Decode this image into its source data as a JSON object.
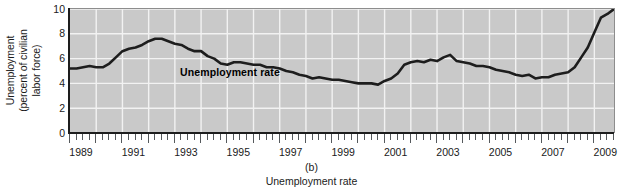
{
  "figure": {
    "panel_letter": "(b)",
    "caption_title": "Unemployment rate",
    "series_label": "Unemployment rate",
    "background_color": "#c9c9c9",
    "gridline_color": "#f2f2f2",
    "line_color": "#1d1d1d",
    "axis_color": "#1d1d1d"
  },
  "axes": {
    "ylabel_line1": "Unemployment",
    "ylabel_line2": "(percent of civilian",
    "ylabel_line3": "labor force)",
    "y_ticks": [
      "0",
      "2",
      "4",
      "6",
      "8",
      "10"
    ],
    "x_ticks": [
      "1989",
      "1991",
      "1993",
      "1995",
      "1997",
      "1999",
      "2001",
      "2003",
      "2005",
      "2007",
      "2009"
    ]
  },
  "chart_data": {
    "type": "line",
    "title": "Unemployment rate",
    "xlabel": "",
    "ylabel": "Unemployment (percent of civilian labor force)",
    "xlim": [
      1989,
      2009.75
    ],
    "ylim": [
      0,
      10
    ],
    "ytick_values": [
      0,
      2,
      4,
      6,
      8,
      10
    ],
    "xtick_values": [
      1989,
      1991,
      1993,
      1995,
      1997,
      1999,
      2001,
      2003,
      2005,
      2007,
      2009
    ],
    "grid": "vertical and horizontal white gridlines at tick values",
    "legend": "inline label inside plot area",
    "annotations": [
      {
        "text": "Unemployment rate",
        "x": 1993.2,
        "y": 4.9,
        "bold": true
      }
    ],
    "series": [
      {
        "name": "Unemployment rate",
        "units": "percent of civilian labor force",
        "x": [
          1989.0,
          1989.25,
          1989.5,
          1989.75,
          1990.0,
          1990.25,
          1990.5,
          1990.75,
          1991.0,
          1991.25,
          1991.5,
          1991.75,
          1992.0,
          1992.25,
          1992.5,
          1992.75,
          1993.0,
          1993.25,
          1993.5,
          1993.75,
          1994.0,
          1994.25,
          1994.5,
          1994.75,
          1995.0,
          1995.25,
          1995.5,
          1995.75,
          1996.0,
          1996.25,
          1996.5,
          1996.75,
          1997.0,
          1997.25,
          1997.5,
          1997.75,
          1998.0,
          1998.25,
          1998.5,
          1998.75,
          1999.0,
          1999.25,
          1999.5,
          1999.75,
          2000.0,
          2000.25,
          2000.5,
          2000.75,
          2001.0,
          2001.25,
          2001.5,
          2001.75,
          2002.0,
          2002.25,
          2002.5,
          2002.75,
          2003.0,
          2003.25,
          2003.5,
          2003.75,
          2004.0,
          2004.25,
          2004.5,
          2004.75,
          2005.0,
          2005.25,
          2005.5,
          2005.75,
          2006.0,
          2006.25,
          2006.5,
          2006.75,
          2007.0,
          2007.25,
          2007.5,
          2007.75,
          2008.0,
          2008.25,
          2008.5,
          2008.75,
          2009.0,
          2009.25,
          2009.5,
          2009.75
        ],
        "y": [
          5.2,
          5.2,
          5.3,
          5.4,
          5.3,
          5.3,
          5.6,
          6.1,
          6.6,
          6.8,
          6.9,
          7.1,
          7.4,
          7.6,
          7.6,
          7.4,
          7.2,
          7.1,
          6.8,
          6.6,
          6.6,
          6.2,
          6.0,
          5.6,
          5.5,
          5.7,
          5.7,
          5.6,
          5.5,
          5.5,
          5.3,
          5.3,
          5.2,
          5.0,
          4.9,
          4.7,
          4.6,
          4.4,
          4.5,
          4.4,
          4.3,
          4.3,
          4.2,
          4.1,
          4.0,
          4.0,
          4.0,
          3.9,
          4.2,
          4.4,
          4.8,
          5.5,
          5.7,
          5.8,
          5.7,
          5.9,
          5.8,
          6.1,
          6.3,
          5.8,
          5.7,
          5.6,
          5.4,
          5.4,
          5.3,
          5.1,
          5.0,
          4.9,
          4.7,
          4.6,
          4.7,
          4.4,
          4.5,
          4.5,
          4.7,
          4.8,
          4.9,
          5.3,
          6.1,
          6.9,
          8.1,
          9.3,
          9.6,
          10.0
        ]
      }
    ]
  }
}
